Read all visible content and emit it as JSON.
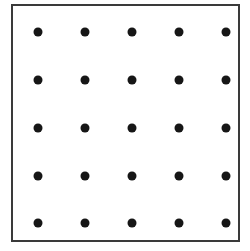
{
  "figure": {
    "name": "dot-grid-figure",
    "canvas": {
      "width": 250,
      "height": 251,
      "background": "#ffffff"
    },
    "frame": {
      "x": 11,
      "y": 4,
      "width": 229,
      "height": 238,
      "border_color": "#3a3a3a",
      "border_width": 2,
      "fill": "#ffffff"
    },
    "dot_style": {
      "color": "#161616",
      "diameter": 9,
      "shape": "circle"
    }
  },
  "chart_data": {
    "type": "scatter",
    "title": "",
    "subtitle": "",
    "xlabel": "",
    "ylabel": "",
    "grid": false,
    "legend": null,
    "rows": 5,
    "columns": 5,
    "point_count": 25,
    "marker": "filled-circle",
    "marker_color": "#161616",
    "marker_size": 9,
    "column_centers_px": [
      38,
      85,
      132,
      179,
      226
    ],
    "row_centers_px": [
      32,
      80,
      128,
      176,
      223
    ],
    "column_spacing_px": 47,
    "row_spacing_px": 48,
    "xlim": [
      11,
      240
    ],
    "ylim": [
      4,
      242
    ],
    "points": [
      {
        "id": "r1c1",
        "row": 1,
        "col": 1,
        "x": 38,
        "y": 32
      },
      {
        "id": "r1c2",
        "row": 1,
        "col": 2,
        "x": 85,
        "y": 32
      },
      {
        "id": "r1c3",
        "row": 1,
        "col": 3,
        "x": 132,
        "y": 32
      },
      {
        "id": "r1c4",
        "row": 1,
        "col": 4,
        "x": 179,
        "y": 32
      },
      {
        "id": "r1c5",
        "row": 1,
        "col": 5,
        "x": 226,
        "y": 32
      },
      {
        "id": "r2c1",
        "row": 2,
        "col": 1,
        "x": 38,
        "y": 80
      },
      {
        "id": "r2c2",
        "row": 2,
        "col": 2,
        "x": 85,
        "y": 80
      },
      {
        "id": "r2c3",
        "row": 2,
        "col": 3,
        "x": 132,
        "y": 80
      },
      {
        "id": "r2c4",
        "row": 2,
        "col": 4,
        "x": 179,
        "y": 80
      },
      {
        "id": "r2c5",
        "row": 2,
        "col": 5,
        "x": 226,
        "y": 80
      },
      {
        "id": "r3c1",
        "row": 3,
        "col": 1,
        "x": 38,
        "y": 128
      },
      {
        "id": "r3c2",
        "row": 3,
        "col": 2,
        "x": 85,
        "y": 128
      },
      {
        "id": "r3c3",
        "row": 3,
        "col": 3,
        "x": 132,
        "y": 128
      },
      {
        "id": "r3c4",
        "row": 3,
        "col": 4,
        "x": 179,
        "y": 128
      },
      {
        "id": "r3c5",
        "row": 3,
        "col": 5,
        "x": 226,
        "y": 128
      },
      {
        "id": "r4c1",
        "row": 4,
        "col": 1,
        "x": 38,
        "y": 176
      },
      {
        "id": "r4c2",
        "row": 4,
        "col": 2,
        "x": 85,
        "y": 176
      },
      {
        "id": "r4c3",
        "row": 4,
        "col": 3,
        "x": 132,
        "y": 176
      },
      {
        "id": "r4c4",
        "row": 4,
        "col": 4,
        "x": 179,
        "y": 176
      },
      {
        "id": "r4c5",
        "row": 4,
        "col": 5,
        "x": 226,
        "y": 176
      },
      {
        "id": "r5c1",
        "row": 5,
        "col": 1,
        "x": 38,
        "y": 223
      },
      {
        "id": "r5c2",
        "row": 5,
        "col": 2,
        "x": 85,
        "y": 223
      },
      {
        "id": "r5c3",
        "row": 5,
        "col": 3,
        "x": 132,
        "y": 223
      },
      {
        "id": "r5c4",
        "row": 5,
        "col": 4,
        "x": 179,
        "y": 223
      },
      {
        "id": "r5c5",
        "row": 5,
        "col": 5,
        "x": 226,
        "y": 223
      }
    ]
  }
}
